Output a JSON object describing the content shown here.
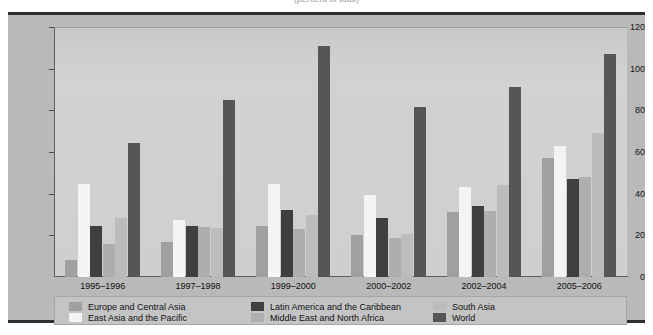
{
  "figure": {
    "title_sliver": "(percent of total)",
    "background_color": "#ffffff",
    "panel_color": "#b9b9b9",
    "plot_color": "#cfcfcf"
  },
  "chart_data": {
    "type": "bar",
    "title": "",
    "xlabel": "",
    "ylabel": "",
    "ylim": [
      0,
      120
    ],
    "yticks": [
      0,
      20,
      40,
      60,
      80,
      100,
      120
    ],
    "grid": false,
    "legend_position": "bottom",
    "categories": [
      "1995–1996",
      "1997–1998",
      "1999–2000",
      "2000–2002",
      "2002–2004",
      "2005–2006"
    ],
    "series": [
      {
        "name": "Europe and Central Asia",
        "color": "#a0a0a0",
        "values": [
          8,
          17,
          24.5,
          20,
          31,
          57
        ]
      },
      {
        "name": "East Asia and the Pacific",
        "color": "#f4f4f4",
        "values": [
          44.5,
          27.5,
          44.5,
          39.5,
          43,
          63
        ]
      },
      {
        "name": "Latin America and the Caribbean",
        "color": "#3f3f3f",
        "values": [
          24.5,
          24.5,
          32,
          28.5,
          34,
          47
        ]
      },
      {
        "name": "Middle East and North Africa",
        "color": "#aeaeae",
        "values": [
          16,
          24,
          23,
          18.5,
          31.5,
          48
        ]
      },
      {
        "name": "South Asia",
        "color": "#bcbcbc",
        "values": [
          28.5,
          23.5,
          30,
          20.5,
          44,
          69
        ]
      },
      {
        "name": "World",
        "color": "#565656",
        "values": [
          64.5,
          85,
          111,
          81.5,
          91,
          107
        ]
      }
    ]
  }
}
